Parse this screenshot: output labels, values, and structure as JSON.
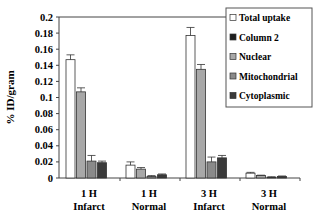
{
  "chart_data": {
    "type": "bar",
    "title": "",
    "xlabel": "",
    "ylabel": "% ID/gram",
    "ylim": [
      0,
      0.2
    ],
    "yticks": [
      0,
      0.02,
      0.04,
      0.06,
      0.08,
      0.1,
      0.12,
      0.14,
      0.16,
      0.18,
      0.2
    ],
    "ytick_labels": [
      "0",
      "0.02",
      "0.04",
      "0.06",
      "0.08",
      "0.1",
      "0.12",
      "0.14",
      "0.16",
      "0.18",
      "0.2"
    ],
    "categories": [
      [
        "1 H",
        "Infarct"
      ],
      [
        "1 H",
        "Normal"
      ],
      [
        "3 H",
        "Infarct"
      ],
      [
        "3 H",
        "Normal"
      ]
    ],
    "legend_position": "right-top",
    "grid": false,
    "series": [
      {
        "name": "Total uptake",
        "color": "#ffffff",
        "values": [
          0.147,
          0.016,
          0.177,
          0.006
        ],
        "errors": [
          0.006,
          0.004,
          0.01,
          0.001
        ]
      },
      {
        "name": "Column 2",
        "color": "#1e1e1e",
        "values": [
          0,
          0,
          0,
          0
        ],
        "errors": [
          0,
          0,
          0,
          0
        ]
      },
      {
        "name": "Nuclear",
        "color": "#a8a8a8",
        "values": [
          0.107,
          0.011,
          0.135,
          0.003
        ],
        "errors": [
          0.005,
          0.002,
          0.006,
          0.0005
        ]
      },
      {
        "name": "Mitochondrial",
        "color": "#8a8a8a",
        "values": [
          0.021,
          0.002,
          0.02,
          0.001
        ],
        "errors": [
          0.007,
          0.001,
          0.006,
          0.0005
        ]
      },
      {
        "name": "Cytoplasmic",
        "color": "#3a3a3a",
        "values": [
          0.019,
          0.004,
          0.025,
          0.002
        ],
        "errors": [
          0.002,
          0.001,
          0.003,
          0.0005
        ]
      }
    ]
  }
}
